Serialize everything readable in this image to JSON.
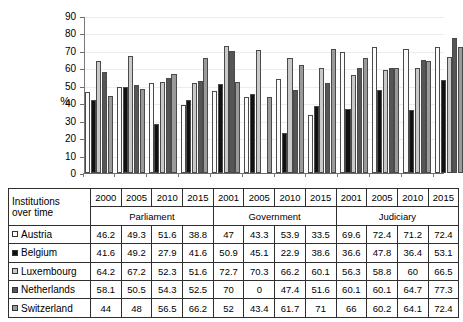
{
  "chart_data": {
    "type": "bar",
    "title": "",
    "xlabel": "",
    "ylabel": "%",
    "ylim": [
      0,
      90
    ],
    "yticks": [
      90,
      80,
      70,
      60,
      50,
      40,
      30,
      20,
      10,
      0
    ],
    "grid": true,
    "legend_position": "table-row-labels",
    "categories": [
      "Parliament 2000",
      "Parliament 2005",
      "Parliament 2010",
      "Parliament 2015",
      "Government 2001",
      "Government 2005",
      "Government 2010",
      "Government 2015",
      "Judiciary 2001",
      "Judiciary 2005",
      "Judiciary 2010",
      "Judiciary 2015"
    ],
    "series": [
      {
        "name": "Austria",
        "color": "#fbfbfb",
        "values": [
          46.2,
          49.3,
          51.6,
          38.8,
          47,
          43.3,
          53.9,
          33.5,
          69.6,
          72.4,
          71.2,
          72.4
        ]
      },
      {
        "name": "Belgium",
        "color": "#111111",
        "values": [
          41.6,
          49.2,
          27.9,
          41.6,
          50.9,
          45.1,
          22.9,
          38.6,
          36.6,
          47.8,
          36.4,
          53.1
        ]
      },
      {
        "name": "Luxembourg",
        "color": "#c9c9c9",
        "values": [
          64.2,
          67.2,
          52.3,
          51.6,
          72.7,
          70.3,
          66.2,
          60.1,
          56.3,
          58.8,
          60,
          66.5
        ]
      },
      {
        "name": "Netherlands",
        "color": "#565656",
        "values": [
          58.1,
          50.5,
          54.3,
          52.5,
          70,
          0,
          47.4,
          51.6,
          60.1,
          60.1,
          64.7,
          77.3
        ]
      },
      {
        "name": "Switzerland",
        "color": "#9a9a9a",
        "values": [
          44,
          48,
          56.5,
          66.2,
          52,
          43.4,
          61.7,
          71,
          66,
          60.2,
          64.1,
          72.4
        ]
      }
    ]
  },
  "table": {
    "corner_label_line1": "Institutions",
    "corner_label_line2": "over time",
    "year_headers": [
      "2000",
      "2005",
      "2010",
      "2015",
      "2001",
      "2005",
      "2010",
      "2015",
      "2001",
      "2005",
      "2010",
      "2015"
    ],
    "group_headers": [
      "Parliament",
      "Government",
      "Judiciary"
    ],
    "rows": [
      {
        "label": "Austria",
        "swatch": "sw0",
        "values": [
          "46.2",
          "49.3",
          "51.6",
          "38.8",
          "47",
          "43.3",
          "53.9",
          "33.5",
          "69.6",
          "72.4",
          "71.2",
          "72.4"
        ]
      },
      {
        "label": "Belgium",
        "swatch": "sw1",
        "values": [
          "41.6",
          "49.2",
          "27.9",
          "41.6",
          "50.9",
          "45.1",
          "22.9",
          "38.6",
          "36.6",
          "47.8",
          "36.4",
          "53.1"
        ]
      },
      {
        "label": "Luxembourg",
        "swatch": "sw2",
        "values": [
          "64.2",
          "67.2",
          "52.3",
          "51.6",
          "72.7",
          "70.3",
          "66.2",
          "60.1",
          "56.3",
          "58.8",
          "60",
          "66.5"
        ]
      },
      {
        "label": "Netherlands",
        "swatch": "sw3",
        "values": [
          "58.1",
          "50.5",
          "54.3",
          "52.5",
          "70",
          "0",
          "47.4",
          "51.6",
          "60.1",
          "60.1",
          "64.7",
          "77.3"
        ]
      },
      {
        "label": "Switzerland",
        "swatch": "sw4",
        "values": [
          "44",
          "48",
          "56.5",
          "66.2",
          "52",
          "43.4",
          "61.7",
          "71",
          "66",
          "60.2",
          "64.1",
          "72.4"
        ]
      }
    ]
  }
}
